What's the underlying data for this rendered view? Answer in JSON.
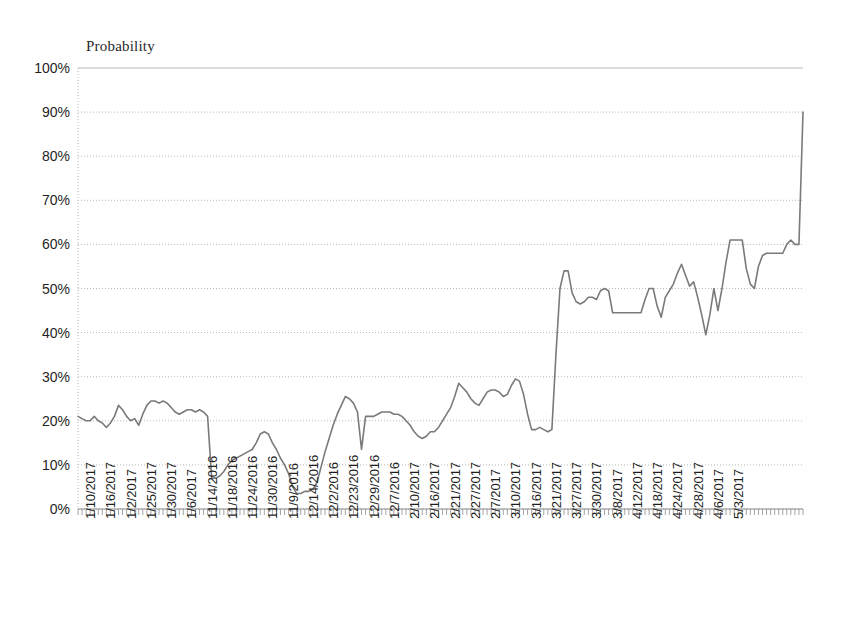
{
  "chart_data": {
    "type": "line",
    "title": "",
    "subtitle": "",
    "ylabel": "Probability",
    "xlabel": "",
    "ylim": [
      0,
      100
    ],
    "y_unit": "%",
    "grid": true,
    "legend": false,
    "legend_position": "none",
    "series_color": "#7a7a7a",
    "y_ticks": [
      "0%",
      "10%",
      "20%",
      "30%",
      "40%",
      "50%",
      "60%",
      "70%",
      "80%",
      "90%",
      "100%"
    ],
    "y_tick_values": [
      0,
      10,
      20,
      30,
      40,
      50,
      60,
      70,
      80,
      90,
      100
    ],
    "x_tick_labels": [
      "1/10/2017",
      "1/16/2017",
      "1/2/2017",
      "1/25/2017",
      "1/30/2017",
      "1/6/2017",
      "11/14/2016",
      "11/18/2016",
      "11/24/2016",
      "11/30/2016",
      "11/9/2016",
      "12/14/2016",
      "12/2/2016",
      "12/23/2016",
      "12/29/2016",
      "12/7/2016",
      "2/10/2017",
      "2/16/2017",
      "2/21/2017",
      "2/27/2017",
      "2/7/2017",
      "3/10/2017",
      "3/16/2017",
      "3/21/2017",
      "3/27/2017",
      "3/30/2017",
      "3/8/2017",
      "4/12/2017",
      "4/18/2017",
      "4/24/2017",
      "4/28/2017",
      "4/6/2017",
      "5/3/2017"
    ],
    "x_label_interval": 5,
    "series": [
      {
        "name": "Probability",
        "values": [
          21,
          20.5,
          20,
          20,
          21,
          20,
          19.5,
          18.5,
          19.5,
          21,
          23.5,
          22.5,
          21,
          20,
          20.5,
          19,
          21.5,
          23.5,
          24.5,
          24.5,
          24,
          24.5,
          24,
          23,
          22,
          21.5,
          22,
          22.5,
          22.5,
          22,
          22.5,
          22,
          21,
          7,
          7,
          7.5,
          8.5,
          10,
          11,
          11.5,
          12,
          12.5,
          13,
          13.5,
          15,
          17,
          17.5,
          17,
          15,
          13.5,
          11.5,
          10,
          8,
          5,
          3.5,
          3.5,
          4,
          4,
          4.5,
          6,
          9.5,
          13,
          16,
          19,
          21.5,
          23.5,
          25.5,
          25,
          24,
          22,
          13.5,
          21,
          21,
          21,
          21.5,
          22,
          22,
          22,
          21.5,
          21.5,
          21,
          20,
          19,
          17.5,
          16.5,
          16,
          16.5,
          17.5,
          17.5,
          18.5,
          20,
          21.5,
          23,
          25.5,
          28.5,
          27.5,
          26.5,
          25,
          24,
          23.5,
          25,
          26.5,
          27,
          27,
          26.5,
          25.5,
          26,
          28,
          29.5,
          29,
          26,
          21.5,
          18,
          18,
          18.5,
          18,
          17.5,
          18,
          35,
          50,
          54,
          54,
          49,
          47,
          46.5,
          47,
          48,
          48,
          47.5,
          49.5,
          50,
          49.5,
          44.5,
          44.5,
          44.5,
          44.5,
          44.5,
          44.5,
          44.5,
          44.5,
          47.5,
          50,
          50,
          46,
          43.5,
          48,
          49.5,
          51,
          53.5,
          55.5,
          53,
          50.5,
          51.5,
          48,
          44,
          39.5,
          44,
          50,
          45,
          50,
          56,
          61,
          61,
          61,
          61,
          54.5,
          51,
          50,
          55,
          57.5,
          58,
          58,
          58,
          58,
          58,
          60,
          61,
          60,
          60,
          90
        ]
      }
    ]
  },
  "axes": {
    "y_title": "Probability"
  }
}
